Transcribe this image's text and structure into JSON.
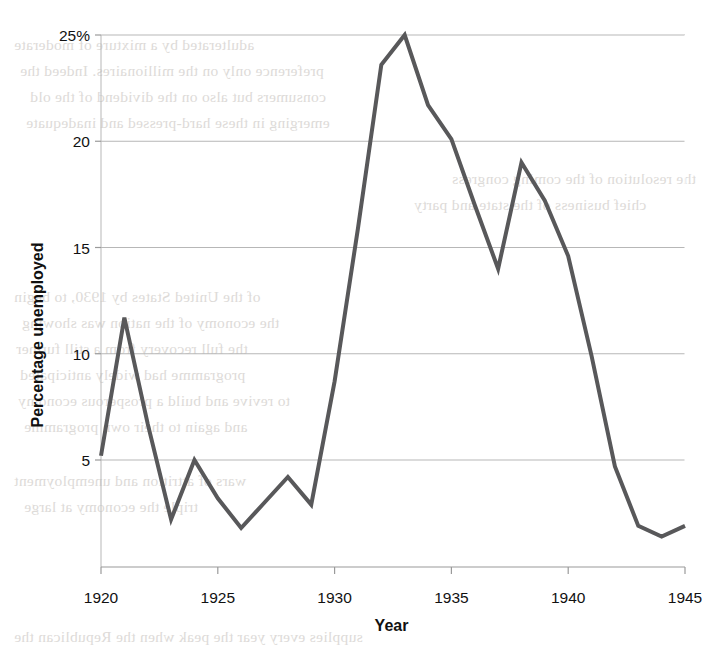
{
  "chart_data": {
    "type": "line",
    "title": "",
    "xlabel": "Year",
    "ylabel": "Percentage unemployed",
    "xlim": [
      1920,
      1945
    ],
    "ylim": [
      0,
      25
    ],
    "grid": true,
    "legend": null,
    "line_color": "#58585a",
    "line_width": 4,
    "x_ticks": [
      "1920",
      "1925",
      "1930",
      "1935",
      "1940",
      "1945"
    ],
    "x_tick_values": [
      1920,
      1925,
      1930,
      1935,
      1940,
      1945
    ],
    "y_ticks": [
      "5",
      "10",
      "15",
      "20",
      "25%"
    ],
    "y_tick_values": [
      5,
      10,
      15,
      20,
      25
    ],
    "x": [
      1920,
      1921,
      1922,
      1923,
      1924,
      1925,
      1926,
      1927,
      1928,
      1929,
      1930,
      1931,
      1932,
      1933,
      1934,
      1935,
      1936,
      1937,
      1938,
      1939,
      1940,
      1941,
      1942,
      1943,
      1944,
      1945
    ],
    "values": [
      5.2,
      11.7,
      6.7,
      2.2,
      5.0,
      3.2,
      1.8,
      3.0,
      4.2,
      2.9,
      8.7,
      15.9,
      23.6,
      25.0,
      21.7,
      20.1,
      17.0,
      14.0,
      19.0,
      17.2,
      14.6,
      9.9,
      4.7,
      1.9,
      1.4,
      1.9
    ],
    "series": [
      {
        "name": "Percentage unemployed",
        "values": [
          5.2,
          11.7,
          6.7,
          2.2,
          5.0,
          3.2,
          1.8,
          3.0,
          4.2,
          2.9,
          8.7,
          15.9,
          23.6,
          25.0,
          21.7,
          20.1,
          17.0,
          14.0,
          19.0,
          17.2,
          14.6,
          9.9,
          4.7,
          1.9,
          1.4,
          1.9
        ]
      }
    ]
  },
  "axes": {
    "y_axis_title": "Percentage unemployed",
    "x_axis_title": "Year"
  },
  "bleed_text": [
    {
      "text": "adulterated by a mixture of moderate",
      "x": 14,
      "y": 36
    },
    {
      "text": "preference only on the millionaires. Indeed the",
      "x": 20,
      "y": 62
    },
    {
      "text": "consumers but also on the dividend of the old",
      "x": 30,
      "y": 88
    },
    {
      "text": "emerging in these hard-pressed and inadequate",
      "x": 26,
      "y": 114
    },
    {
      "text": "the resolution of the coming congress",
      "x": 452,
      "y": 170
    },
    {
      "text": "chief business of the state and party",
      "x": 414,
      "y": 196
    },
    {
      "text": "of the United States by 1930, to begin",
      "x": 14,
      "y": 288
    },
    {
      "text": "the economy of the nation was showing",
      "x": 22,
      "y": 314
    },
    {
      "text": "the full recovery from a still further",
      "x": 16,
      "y": 340
    },
    {
      "text": "programme had widely anticipated",
      "x": 20,
      "y": 366
    },
    {
      "text": "to revive and build a prosperous economy",
      "x": 18,
      "y": 392
    },
    {
      "text": "and again to their own programme",
      "x": 24,
      "y": 418
    },
    {
      "text": "wars of attrition and unemployment",
      "x": 14,
      "y": 472
    },
    {
      "text": "triple the economy at large",
      "x": 24,
      "y": 498
    },
    {
      "text": "supplies every year the peak when the Republican the",
      "x": 14,
      "y": 628
    }
  ]
}
